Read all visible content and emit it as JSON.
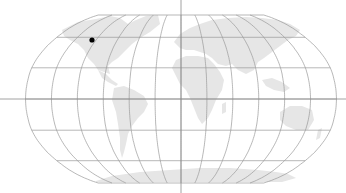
{
  "map": {
    "projection": "robinson",
    "width": 346,
    "height": 193,
    "colors": {
      "background": "#ffffff",
      "land": "#e6e6e6",
      "graticule": "#9a9a9a",
      "crosshair": "#8c8c8c",
      "marker": "#000000"
    },
    "graticule_step_degrees": 30,
    "crosshair": {
      "x": 181,
      "y": 99
    },
    "marker": {
      "label": "location-marker",
      "x": 92,
      "y": 40,
      "radius": 2.6
    }
  }
}
